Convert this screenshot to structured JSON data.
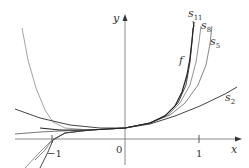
{
  "figure": {
    "axes": {
      "x_label": "x",
      "y_label": "y",
      "origin_label": "0",
      "tick_labels": {
        "neg_one": "−1",
        "one": "1"
      }
    },
    "curve_labels": {
      "f": "f",
      "s2": {
        "base": "s",
        "sub": "2"
      },
      "s5": {
        "base": "s",
        "sub": "5"
      },
      "s8": {
        "base": "s",
        "sub": "8"
      },
      "s11": {
        "base": "s",
        "sub": "11"
      }
    },
    "colors": {
      "axis": "#8a8a8a",
      "f": "#222222",
      "s2": "#444444",
      "s5": "#777777",
      "s8": "#888888",
      "s11": "#333333",
      "left_branch": "#999999"
    },
    "curves": {
      "f": [
        [
          40,
          128
        ],
        [
          60,
          130
        ],
        [
          90,
          130
        ],
        [
          125,
          128
        ],
        [
          150,
          123
        ],
        [
          165,
          116
        ],
        [
          175,
          106
        ],
        [
          182,
          92
        ],
        [
          187,
          75
        ],
        [
          190,
          58
        ],
        [
          192,
          40
        ],
        [
          194,
          22
        ]
      ],
      "s2": [
        [
          15,
          109
        ],
        [
          40,
          118
        ],
        [
          70,
          125
        ],
        [
          100,
          128
        ],
        [
          125,
          128
        ],
        [
          150,
          124
        ],
        [
          175,
          116
        ],
        [
          200,
          106
        ],
        [
          225,
          94
        ],
        [
          237,
          87
        ]
      ],
      "s5": [
        [
          35,
          160
        ],
        [
          45,
          150
        ],
        [
          52,
          140
        ],
        [
          65,
          133
        ],
        [
          90,
          130
        ],
        [
          125,
          128
        ],
        [
          150,
          123
        ],
        [
          170,
          115
        ],
        [
          185,
          103
        ],
        [
          198,
          85
        ],
        [
          206,
          65
        ],
        [
          210,
          44
        ],
        [
          212,
          26
        ]
      ],
      "s8": [
        [
          25,
          168
        ],
        [
          40,
          152
        ],
        [
          52,
          140
        ],
        [
          65,
          133
        ],
        [
          90,
          130
        ],
        [
          125,
          128
        ],
        [
          150,
          123
        ],
        [
          168,
          115
        ],
        [
          180,
          103
        ],
        [
          190,
          85
        ],
        [
          196,
          62
        ],
        [
          199,
          42
        ],
        [
          201,
          26
        ]
      ],
      "s11": [
        [
          40,
          168
        ],
        [
          48,
          152
        ],
        [
          53,
          140
        ],
        [
          65,
          133
        ],
        [
          90,
          130
        ],
        [
          125,
          128
        ],
        [
          150,
          123
        ],
        [
          166,
          115
        ],
        [
          178,
          103
        ],
        [
          186,
          85
        ],
        [
          190,
          62
        ],
        [
          192,
          42
        ],
        [
          193,
          28
        ]
      ],
      "left_branch": [
        [
          22,
          28
        ],
        [
          28,
          60
        ],
        [
          36,
          88
        ],
        [
          45,
          110
        ],
        [
          53,
          122
        ],
        [
          65,
          128
        ],
        [
          90,
          130
        ]
      ],
      "flat": [
        [
          15,
          134
        ],
        [
          40,
          132
        ],
        [
          60,
          131
        ],
        [
          90,
          130
        ]
      ]
    }
  }
}
